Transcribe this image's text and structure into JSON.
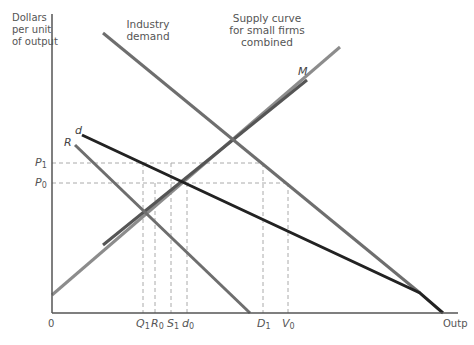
{
  "axes": {
    "y_label": "Dollars per unit of output",
    "y_label_lines": [
      "Dollars",
      "per unit",
      "of output"
    ],
    "x_label": "Outp",
    "origin": "0"
  },
  "labels": {
    "industry_demand": [
      "Industry",
      "demand"
    ],
    "supply": [
      "Supply curve",
      "for small firms",
      "combined"
    ],
    "M": "M",
    "d": "d",
    "R": "R"
  },
  "price_ticks": [
    {
      "name": "P",
      "sub": "1"
    },
    {
      "name": "P",
      "sub": "0"
    }
  ],
  "quantity_ticks": [
    {
      "name": "Q",
      "sub": "1"
    },
    {
      "name": "R",
      "sub": "0"
    },
    {
      "name": "S",
      "sub": "1"
    },
    {
      "name": "d",
      "sub": "0"
    },
    {
      "name": "D",
      "sub": "1"
    },
    {
      "name": "V",
      "sub": "0"
    }
  ],
  "colors": {
    "axis": "#555555",
    "industry_demand": "#6e6e6e",
    "supply": "#8c8c8c",
    "M": "#555555",
    "d": "#222222",
    "R": "#6e6e6e",
    "dashed": "#aaaaaa"
  }
}
